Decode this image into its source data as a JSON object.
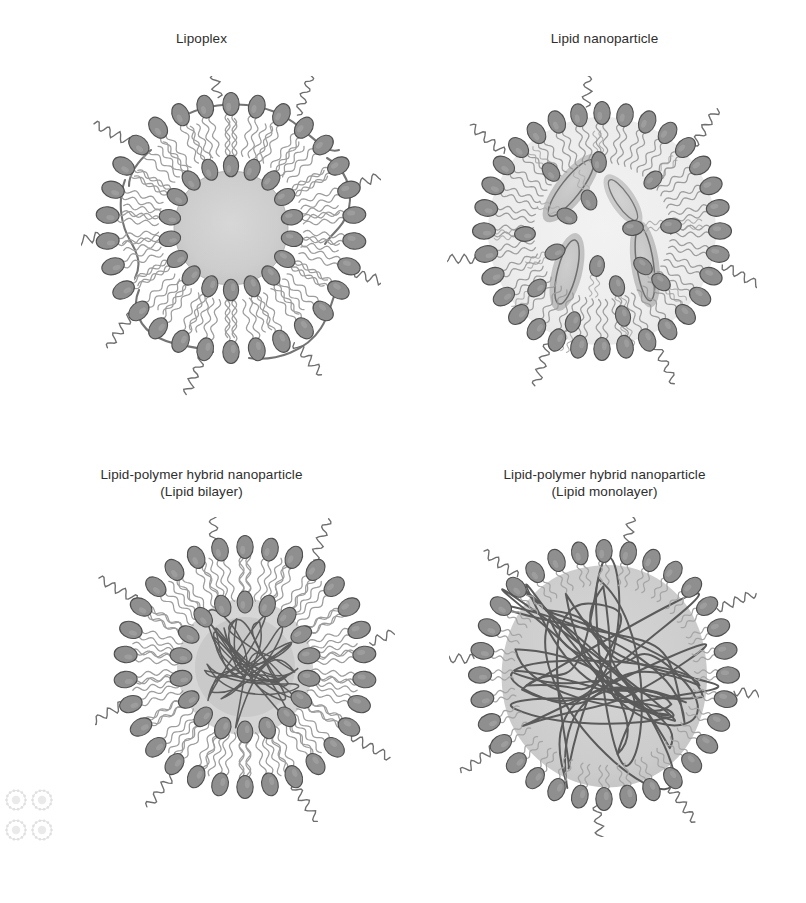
{
  "figure": {
    "background_color": "#ffffff",
    "panel_count": 4
  },
  "palette": {
    "lipid_head_fill": "#8f8f8f",
    "lipid_head_stroke": "#4a4a4a",
    "lipid_tail_stroke": "#9a9a9a",
    "peg_chain_stroke": "#6e6e6e",
    "core_fill": "#cfcfcf",
    "core_fill_light": "#dcdcdc",
    "polymer_strand_stroke": "#5a5a5a",
    "dna_strand_stroke": "#6a6a6a",
    "lens_fill": "#bdbdbd",
    "text_color": "#2e2e2e",
    "caption_color": "#d8d8d8"
  },
  "panels": [
    {
      "id": "lipoplex",
      "title_lines": [
        "Lipoplex"
      ],
      "subtitle": "",
      "structure": "bilayer-vesicle-with-dna",
      "features": [
        "outer lipid leaflet heads facing outward",
        "inner lipid leaflet heads facing gray aqueous core",
        "hydrophobic tails between leaflets",
        "condensed nucleic acid core (gray disc)",
        "dark DNA strands threading around the outer leaflet"
      ],
      "outer_head_count": 30,
      "inner_head_count": 18,
      "peg_chain_count": 9,
      "dna_arc_count": 6,
      "core_radius_px": 58
    },
    {
      "id": "lipid-nanoparticle",
      "title_lines": [
        "Lipid nanoparticle"
      ],
      "subtitle": "",
      "structure": "solid-lipid-core-with-inverted-micelles",
      "features": [
        "outer lipid monolayer heads facing outward",
        "dense interior lipid packing",
        "inverted micelle lens bodies encapsulating nucleic acid",
        "interior heads distributed through core"
      ],
      "outer_head_count": 32,
      "interior_head_count": 16,
      "peg_chain_count": 7,
      "lens_count": 4,
      "core_radius_px": 112
    },
    {
      "id": "lipid-polymer-hybrid-bilayer",
      "title_lines": [
        "Lipid-polymer hybrid nanoparticle",
        "(Lipid bilayer)"
      ],
      "subtitle": "(Lipid bilayer)",
      "structure": "bilayer-shell-with-small-polymer-core",
      "features": [
        "outer lipid leaflet heads facing outward",
        "inner lipid leaflet heads facing polymer core",
        "tails sandwiched between the two leaflets",
        "compact tangled polymer matrix at the centre"
      ],
      "outer_head_count": 30,
      "inner_head_count": 18,
      "peg_chain_count": 8,
      "polymer_strand_count": 14,
      "core_radius_px": 52
    },
    {
      "id": "lipid-polymer-hybrid-monolayer",
      "title_lines": [
        "Lipid-polymer hybrid nanoparticle",
        "(Lipid monolayer)"
      ],
      "subtitle": "(Lipid monolayer)",
      "structure": "monolayer-shell-with-large-polymer-core",
      "features": [
        "single lipid monolayer heads facing outward",
        "tails anchored into the polymer core surface",
        "large tangled polymer matrix filling the particle",
        "no inner lipid leaflet"
      ],
      "outer_head_count": 32,
      "inner_head_count": 0,
      "peg_chain_count": 8,
      "polymer_strand_count": 18,
      "core_radius_px": 100
    }
  ],
  "caption": {
    "text": "",
    "visible": false,
    "note": "bottom caption line is cropped and illegible in the source image"
  },
  "thumbnails": {
    "count": 4,
    "description": "faint miniature previews of the four panels in the lower-left corner"
  }
}
